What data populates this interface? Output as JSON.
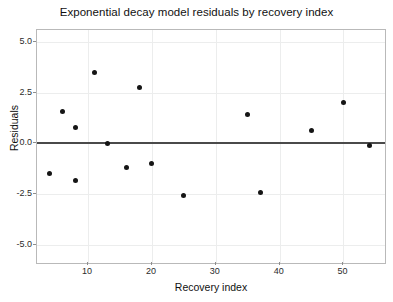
{
  "chart_data": {
    "type": "scatter",
    "title": "Exponential decay model residuals by recovery index",
    "xlabel": "Recovery index",
    "ylabel": "Residuals",
    "xlim": [
      2,
      56.5
    ],
    "ylim": [
      -5.9,
      5.6
    ],
    "xticks": [
      10,
      20,
      30,
      40,
      50
    ],
    "xtick_labels": [
      "10",
      "20",
      "30",
      "40",
      "50"
    ],
    "yticks": [
      5.0,
      2.5,
      0.0,
      -2.5,
      -5.0
    ],
    "ytick_labels": [
      "5.0",
      "2.5",
      "0.0",
      "-2.5",
      "-5.0"
    ],
    "grid": true,
    "legend": null,
    "reference_line": {
      "y": 0,
      "color": "#4a4a4a"
    },
    "marker_color": "#151515",
    "x": [
      4,
      6,
      8,
      8,
      11,
      13,
      16,
      18,
      20,
      25,
      35,
      37,
      45,
      50,
      54
    ],
    "y": [
      -1.5,
      1.6,
      0.8,
      -1.85,
      3.5,
      0.0,
      -1.2,
      2.75,
      -1.0,
      -2.55,
      1.45,
      -2.4,
      0.65,
      2.0,
      -0.1
    ],
    "points": [
      {
        "x": 4,
        "y": -1.5
      },
      {
        "x": 6,
        "y": 1.6
      },
      {
        "x": 8,
        "y": 0.8
      },
      {
        "x": 8,
        "y": -1.85
      },
      {
        "x": 11,
        "y": 3.5
      },
      {
        "x": 13,
        "y": 0.0
      },
      {
        "x": 16,
        "y": -1.2
      },
      {
        "x": 18,
        "y": 2.75
      },
      {
        "x": 20,
        "y": -1.0
      },
      {
        "x": 25,
        "y": -2.55
      },
      {
        "x": 35,
        "y": 1.45
      },
      {
        "x": 37,
        "y": -2.4
      },
      {
        "x": 45,
        "y": 0.65
      },
      {
        "x": 50,
        "y": 2.0
      },
      {
        "x": 54,
        "y": -0.1
      }
    ]
  }
}
